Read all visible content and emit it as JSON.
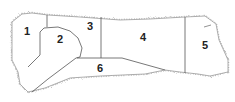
{
  "diagram": {
    "title": "",
    "type": "meat-cut-chart",
    "regions": [
      {
        "id": "1",
        "label": "1"
      },
      {
        "id": "2",
        "label": "2"
      },
      {
        "id": "3",
        "label": "3"
      },
      {
        "id": "4",
        "label": "4"
      },
      {
        "id": "5",
        "label": "5"
      },
      {
        "id": "6",
        "label": "6"
      }
    ],
    "colors": {
      "outline": "#555555",
      "fill": "#ffffff",
      "texture": "#b5b5b5"
    }
  }
}
